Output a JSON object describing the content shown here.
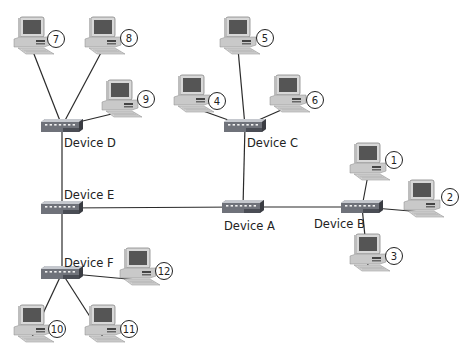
{
  "diagram": {
    "type": "network-topology",
    "devices": [
      {
        "id": "A",
        "label": "Device A",
        "x": 243,
        "y": 207,
        "lx": 224,
        "ly": 230
      },
      {
        "id": "B",
        "label": "Device B",
        "x": 362,
        "y": 207,
        "lx": 314,
        "ly": 228
      },
      {
        "id": "C",
        "label": "Device C",
        "x": 245,
        "y": 126,
        "lx": 247,
        "ly": 147
      },
      {
        "id": "D",
        "label": "Device D",
        "x": 62,
        "y": 126,
        "lx": 64,
        "ly": 147
      },
      {
        "id": "E",
        "label": "Device E",
        "x": 62,
        "y": 208,
        "lx": 64,
        "ly": 199
      },
      {
        "id": "F",
        "label": "Device F",
        "x": 62,
        "y": 273,
        "lx": 64,
        "ly": 267
      }
    ],
    "computers": [
      {
        "id": "1",
        "label": "1",
        "x": 368,
        "y": 163,
        "nx": 394,
        "ny": 160,
        "hub": "B"
      },
      {
        "id": "2",
        "label": "2",
        "x": 422,
        "y": 200,
        "nx": 450,
        "ny": 197,
        "hub": "B"
      },
      {
        "id": "3",
        "label": "3",
        "x": 368,
        "y": 254,
        "nx": 394,
        "ny": 256,
        "hub": "B"
      },
      {
        "id": "4",
        "label": "4",
        "x": 192,
        "y": 95,
        "nx": 217,
        "ny": 101,
        "hub": "C"
      },
      {
        "id": "5",
        "label": "5",
        "x": 238,
        "y": 37,
        "nx": 265,
        "ny": 38,
        "hub": "C"
      },
      {
        "id": "6",
        "label": "6",
        "x": 288,
        "y": 95,
        "nx": 315,
        "ny": 100,
        "hub": "C"
      },
      {
        "id": "7",
        "label": "7",
        "x": 32,
        "y": 37,
        "nx": 56,
        "ny": 39,
        "hub": "D"
      },
      {
        "id": "8",
        "label": "8",
        "x": 103,
        "y": 37,
        "nx": 129,
        "ny": 38,
        "hub": "D"
      },
      {
        "id": "9",
        "label": "9",
        "x": 120,
        "y": 100,
        "nx": 146,
        "ny": 99,
        "hub": "D"
      },
      {
        "id": "10",
        "label": "10",
        "x": 32,
        "y": 325,
        "nx": 57,
        "ny": 329,
        "hub": "F"
      },
      {
        "id": "11",
        "label": "11",
        "x": 103,
        "y": 325,
        "nx": 129,
        "ny": 329,
        "hub": "F"
      },
      {
        "id": "12",
        "label": "12",
        "x": 138,
        "y": 268,
        "nx": 164,
        "ny": 271,
        "hub": "F"
      }
    ],
    "links": [
      {
        "from": "D",
        "to": "E"
      },
      {
        "from": "E",
        "to": "F"
      },
      {
        "from": "E",
        "to": "A"
      },
      {
        "from": "A",
        "to": "C"
      },
      {
        "from": "A",
        "to": "B"
      }
    ]
  },
  "colors": {
    "line": "#2a2a2a",
    "hub_body": "#8a8d94",
    "hub_top": "#c5c8ce",
    "hub_front": "#4a4d55",
    "monitor": "#d8d8d8",
    "screen": "#555555"
  }
}
